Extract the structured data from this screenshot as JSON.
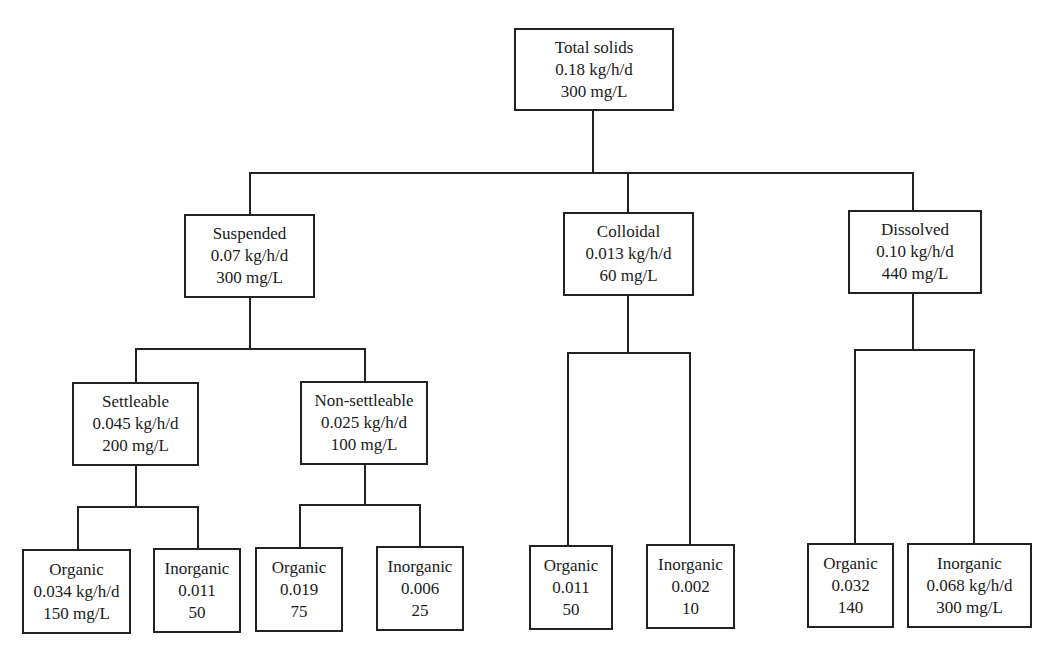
{
  "diagram": {
    "type": "tree",
    "root": {
      "id": "total",
      "label": "Total solids",
      "load": "0.18 kg/h/d",
      "conc": "300 mg/L"
    },
    "level1": {
      "suspended": {
        "label": "Suspended",
        "load": "0.07 kg/h/d",
        "conc": "300 mg/L"
      },
      "colloidal": {
        "label": "Colloidal",
        "load": "0.013 kg/h/d",
        "conc": "60 mg/L"
      },
      "dissolved": {
        "label": "Dissolved",
        "load": "0.10 kg/h/d",
        "conc": "440 mg/L"
      }
    },
    "level2": {
      "settleable": {
        "label": "Settleable",
        "load": "0.045 kg/h/d",
        "conc": "200 mg/L"
      },
      "non_settleable": {
        "label": "Non-settleable",
        "load": "0.025 kg/h/d",
        "conc": "100 mg/L"
      }
    },
    "leaves": {
      "settleable_organic": {
        "label": "Organic",
        "load": "0.034 kg/h/d",
        "conc": "150 mg/L"
      },
      "settleable_inorganic": {
        "label": "Inorganic",
        "load": "0.011",
        "conc": "50"
      },
      "nonsettleable_organic": {
        "label": "Organic",
        "load": "0.019",
        "conc": "75"
      },
      "nonsettleable_inorganic": {
        "label": "Inorganic",
        "load": "0.006",
        "conc": "25"
      },
      "colloidal_organic": {
        "label": "Organic",
        "load": "0.011",
        "conc": "50"
      },
      "colloidal_inorganic": {
        "label": "Inorganic",
        "load": "0.002",
        "conc": "10"
      },
      "dissolved_organic": {
        "label": "Organic",
        "load": "0.032",
        "conc": "140"
      },
      "dissolved_inorganic": {
        "label": "Inorganic",
        "load": "0.068 kg/h/d",
        "conc": "300 mg/L"
      }
    }
  },
  "colors": {
    "line": "#222222",
    "background": "#ffffff",
    "text": "#1a1a1a"
  }
}
